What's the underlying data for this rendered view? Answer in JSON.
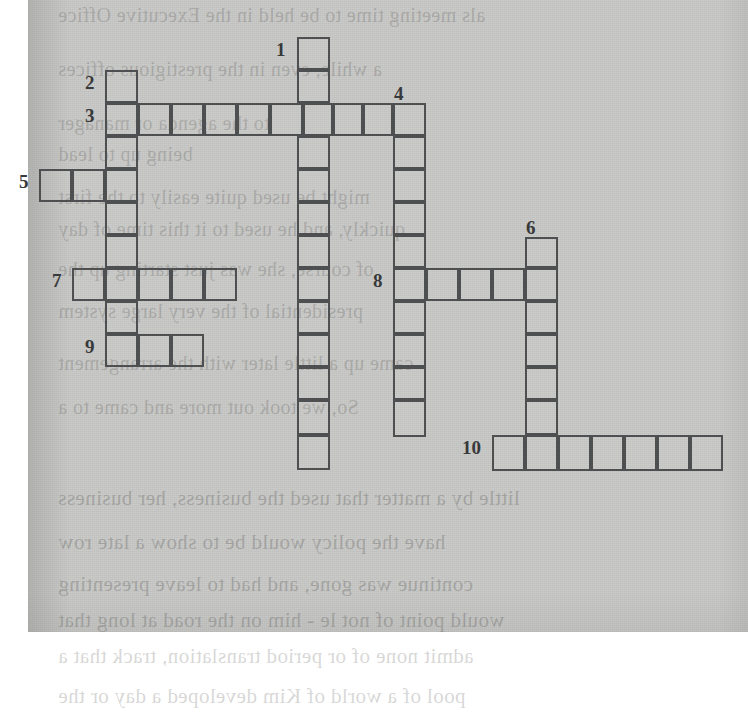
{
  "document": {
    "type": "crossword-puzzle",
    "title": "",
    "paper_color": "#c9c9c7",
    "ink_color": "#4d4f50",
    "number_color": "#38393a"
  },
  "grid": {
    "cell_size": 33,
    "origin_x": 39,
    "origin_y": 37,
    "total_cells": 63,
    "entries": [
      {
        "number": "1",
        "direction": "down",
        "length": 13,
        "start_x": 297,
        "start_y": 37,
        "label_x": 276,
        "label_y": 40
      },
      {
        "number": "2",
        "direction": "down",
        "length": 9,
        "start_x": 105,
        "start_y": 70,
        "label_x": 85,
        "label_y": 73
      },
      {
        "number": "3",
        "direction": "across",
        "length": 10,
        "start_x": 105,
        "start_y": 103,
        "label_x": 85,
        "label_y": 106
      },
      {
        "number": "4",
        "direction": "down",
        "length": 10,
        "start_x": 393,
        "start_y": 103,
        "label_x": 394,
        "label_y": 84
      },
      {
        "number": "5",
        "direction": "across",
        "length": 3,
        "start_x": 39,
        "start_y": 169,
        "label_x": 19,
        "label_y": 172
      },
      {
        "number": "6",
        "direction": "down",
        "length": 7,
        "start_x": 525,
        "start_y": 237,
        "label_x": 526,
        "label_y": 218
      },
      {
        "number": "7",
        "direction": "across",
        "length": 5,
        "start_x": 72,
        "start_y": 268,
        "label_x": 52,
        "label_y": 271
      },
      {
        "number": "8",
        "direction": "across",
        "length": 5,
        "start_x": 393,
        "start_y": 268,
        "label_x": 373,
        "label_y": 271
      },
      {
        "number": "9",
        "direction": "across",
        "length": 3,
        "start_x": 105,
        "start_y": 334,
        "label_x": 85,
        "label_y": 337
      },
      {
        "number": "10",
        "direction": "across",
        "length": 7,
        "start_x": 492,
        "start_y": 435,
        "label_x": 462,
        "label_y": 438
      }
    ],
    "cells": [
      {
        "x": 297,
        "y": 37,
        "w": 33,
        "h": 33
      },
      {
        "x": 297,
        "y": 70,
        "w": 33,
        "h": 33
      },
      {
        "x": 105,
        "y": 70,
        "w": 33,
        "h": 33
      },
      {
        "x": 105,
        "y": 103,
        "w": 33,
        "h": 33
      },
      {
        "x": 138,
        "y": 103,
        "w": 33,
        "h": 33
      },
      {
        "x": 171,
        "y": 103,
        "w": 33,
        "h": 33
      },
      {
        "x": 204,
        "y": 103,
        "w": 33,
        "h": 33
      },
      {
        "x": 237,
        "y": 103,
        "w": 33,
        "h": 33
      },
      {
        "x": 270,
        "y": 103,
        "w": 33,
        "h": 33
      },
      {
        "x": 303,
        "y": 103,
        "w": 30,
        "h": 33
      },
      {
        "x": 333,
        "y": 103,
        "w": 30,
        "h": 33
      },
      {
        "x": 363,
        "y": 103,
        "w": 30,
        "h": 33
      },
      {
        "x": 393,
        "y": 103,
        "w": 33,
        "h": 33
      },
      {
        "x": 105,
        "y": 136,
        "w": 33,
        "h": 33
      },
      {
        "x": 297,
        "y": 136,
        "w": 33,
        "h": 33
      },
      {
        "x": 393,
        "y": 136,
        "w": 33,
        "h": 33
      },
      {
        "x": 39,
        "y": 169,
        "w": 33,
        "h": 33
      },
      {
        "x": 72,
        "y": 169,
        "w": 33,
        "h": 33
      },
      {
        "x": 105,
        "y": 169,
        "w": 33,
        "h": 33
      },
      {
        "x": 297,
        "y": 169,
        "w": 33,
        "h": 33
      },
      {
        "x": 393,
        "y": 169,
        "w": 33,
        "h": 33
      },
      {
        "x": 105,
        "y": 202,
        "w": 33,
        "h": 33
      },
      {
        "x": 297,
        "y": 202,
        "w": 33,
        "h": 33
      },
      {
        "x": 393,
        "y": 202,
        "w": 33,
        "h": 33
      },
      {
        "x": 105,
        "y": 235,
        "w": 33,
        "h": 33
      },
      {
        "x": 297,
        "y": 235,
        "w": 33,
        "h": 33
      },
      {
        "x": 393,
        "y": 235,
        "w": 33,
        "h": 33
      },
      {
        "x": 525,
        "y": 237,
        "w": 33,
        "h": 31
      },
      {
        "x": 72,
        "y": 268,
        "w": 33,
        "h": 33
      },
      {
        "x": 105,
        "y": 268,
        "w": 33,
        "h": 33
      },
      {
        "x": 138,
        "y": 268,
        "w": 33,
        "h": 33
      },
      {
        "x": 171,
        "y": 268,
        "w": 33,
        "h": 33
      },
      {
        "x": 204,
        "y": 268,
        "w": 33,
        "h": 33
      },
      {
        "x": 297,
        "y": 268,
        "w": 33,
        "h": 33
      },
      {
        "x": 393,
        "y": 268,
        "w": 33,
        "h": 33
      },
      {
        "x": 426,
        "y": 268,
        "w": 33,
        "h": 33
      },
      {
        "x": 459,
        "y": 268,
        "w": 33,
        "h": 33
      },
      {
        "x": 492,
        "y": 268,
        "w": 33,
        "h": 33
      },
      {
        "x": 525,
        "y": 268,
        "w": 33,
        "h": 33
      },
      {
        "x": 105,
        "y": 301,
        "w": 33,
        "h": 33
      },
      {
        "x": 297,
        "y": 301,
        "w": 33,
        "h": 33
      },
      {
        "x": 393,
        "y": 301,
        "w": 33,
        "h": 33
      },
      {
        "x": 525,
        "y": 301,
        "w": 33,
        "h": 33
      },
      {
        "x": 105,
        "y": 334,
        "w": 33,
        "h": 33
      },
      {
        "x": 138,
        "y": 334,
        "w": 33,
        "h": 33
      },
      {
        "x": 171,
        "y": 334,
        "w": 33,
        "h": 33
      },
      {
        "x": 297,
        "y": 334,
        "w": 33,
        "h": 33
      },
      {
        "x": 393,
        "y": 334,
        "w": 33,
        "h": 33
      },
      {
        "x": 525,
        "y": 334,
        "w": 33,
        "h": 33
      },
      {
        "x": 297,
        "y": 367,
        "w": 33,
        "h": 33
      },
      {
        "x": 393,
        "y": 367,
        "w": 33,
        "h": 33
      },
      {
        "x": 525,
        "y": 367,
        "w": 33,
        "h": 33
      },
      {
        "x": 297,
        "y": 400,
        "w": 33,
        "h": 35
      },
      {
        "x": 393,
        "y": 400,
        "w": 33,
        "h": 37
      },
      {
        "x": 525,
        "y": 400,
        "w": 33,
        "h": 35
      },
      {
        "x": 492,
        "y": 435,
        "w": 33,
        "h": 36
      },
      {
        "x": 525,
        "y": 435,
        "w": 33,
        "h": 36
      },
      {
        "x": 558,
        "y": 435,
        "w": 33,
        "h": 36
      },
      {
        "x": 591,
        "y": 435,
        "w": 33,
        "h": 36
      },
      {
        "x": 624,
        "y": 435,
        "w": 33,
        "h": 36
      },
      {
        "x": 657,
        "y": 435,
        "w": 33,
        "h": 36
      },
      {
        "x": 690,
        "y": 435,
        "w": 33,
        "h": 36
      },
      {
        "x": 297,
        "y": 435,
        "w": 33,
        "h": 35
      }
    ]
  },
  "background_text": {
    "note": "faint mirrored show-through from the reverse side of the page",
    "lines": [
      {
        "text": "als meeting time to be held in the Executive Office",
        "x": 58,
        "y": 4,
        "size": 20
      },
      {
        "text": "a while, even      in the prestigious offices",
        "x": 58,
        "y": 58,
        "size": 20
      },
      {
        "text": "to the agenda or manager",
        "x": 58,
        "y": 112,
        "size": 20
      },
      {
        "text": "being up to lead",
        "x": 58,
        "y": 143,
        "size": 20
      },
      {
        "text": "might be used quite easily to the first",
        "x": 58,
        "y": 186,
        "size": 20
      },
      {
        "text": "quickly, and he used to it this time of day",
        "x": 58,
        "y": 218,
        "size": 20
      },
      {
        "text": "of course, she was just starting up the",
        "x": 58,
        "y": 258,
        "size": 20
      },
      {
        "text": "presidential of the very large system",
        "x": 58,
        "y": 300,
        "size": 20
      },
      {
        "text": "came up a little later with the arrangement",
        "x": 58,
        "y": 352,
        "size": 20
      },
      {
        "text": "So, we took out more and came to a",
        "x": 58,
        "y": 396,
        "size": 20
      },
      {
        "text": "little by a matter that used the business, her business",
        "x": 58,
        "y": 486,
        "size": 21
      },
      {
        "text": "have the policy would be to show a late row",
        "x": 58,
        "y": 530,
        "size": 21
      },
      {
        "text": "continue    was gone, and had to leave presenting",
        "x": 58,
        "y": 572,
        "size": 21
      },
      {
        "text": "would point of not le - him on the road at long that",
        "x": 58,
        "y": 608,
        "size": 21
      },
      {
        "text": "admit none    of or period translation, track that a",
        "x": 58,
        "y": 644,
        "size": 21
      },
      {
        "text": "pool of a world of Kim developed a day or the",
        "x": 58,
        "y": 684,
        "size": 21
      }
    ]
  }
}
